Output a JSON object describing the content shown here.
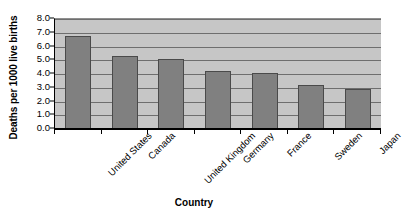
{
  "chart_data": {
    "type": "bar",
    "title": "",
    "xlabel": "Country",
    "ylabel": "Deaths per 1000 live births",
    "categories": [
      "United States",
      "Canada",
      "United Kingdom",
      "Germany",
      "France",
      "Sweden",
      "Japan"
    ],
    "values": [
      6.8,
      5.3,
      5.1,
      4.2,
      4.1,
      3.2,
      2.9
    ],
    "ylim": [
      0.0,
      8.0
    ],
    "ytick_labels": [
      "8.0",
      "7.0",
      "6.0",
      "5.0",
      "4.0",
      "3.0",
      "2.0",
      "1.0",
      "0.0"
    ],
    "ytick_values": [
      8.0,
      7.0,
      6.0,
      5.0,
      4.0,
      3.0,
      2.0,
      1.0,
      0.0
    ],
    "grid": true,
    "legend": "none",
    "colors": {
      "bar_fill": "#808080",
      "bar_border": "#4a4a4a",
      "plot_background": "#c6c6c6",
      "gridline": "#6e6e6e",
      "axis": "#000000",
      "text": "#000000",
      "page_background": "#ffffff"
    }
  }
}
